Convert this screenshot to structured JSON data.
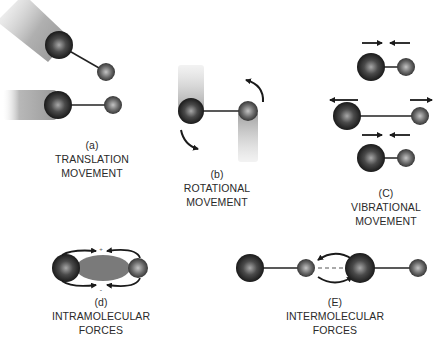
{
  "figure": {
    "panels": [
      {
        "id": "a",
        "letter": "(a)",
        "line1": "TRANSLATION",
        "line2": "MOVEMENT"
      },
      {
        "id": "b",
        "letter": "(b)",
        "line1": "ROTATIONAL",
        "line2": "MOVEMENT"
      },
      {
        "id": "c",
        "letter": "(C)",
        "line1": "VIBRATIONAL",
        "line2": "MOVEMENT"
      },
      {
        "id": "d",
        "letter": "(d)",
        "line1": "INTRAMOLECULAR",
        "line2": "FORCES"
      },
      {
        "id": "e",
        "letter": "(E)",
        "line1": "INTERMOLECULAR",
        "line2": "FORCES"
      }
    ],
    "colors": {
      "atom_dark": "#1a1a1a",
      "atom_light": "#9a9a9a",
      "trail": "#b5b5b5",
      "bond": "#222222",
      "text": "#2a2a2a",
      "electron_cloud": "#7a7a7a"
    }
  }
}
